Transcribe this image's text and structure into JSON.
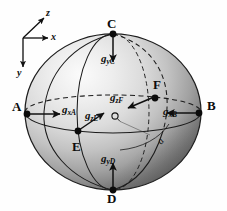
{
  "figure": {
    "background_color": "#fefefe",
    "sphere": {
      "center_x": 113,
      "center_y": 112,
      "radius_x": 88,
      "radius_y": 78,
      "outline_color": "#1a1a1a",
      "highlight_color": "#f2f2f2",
      "shadow_color": "#4a4a4a"
    }
  },
  "axes": {
    "origin_label": "",
    "items": [
      {
        "name": "z-axis",
        "label": "z",
        "direction": "up-right"
      },
      {
        "name": "x-axis",
        "label": "x",
        "direction": "right"
      },
      {
        "name": "y-axis",
        "label": "y",
        "direction": "down"
      }
    ]
  },
  "points": [
    {
      "id": "A",
      "label": "A",
      "position": "left"
    },
    {
      "id": "B",
      "label": "B",
      "position": "right"
    },
    {
      "id": "C",
      "label": "C",
      "position": "top"
    },
    {
      "id": "D",
      "label": "D",
      "position": "bottom"
    },
    {
      "id": "E",
      "label": "E",
      "position": "front-lower-left"
    },
    {
      "id": "F",
      "label": "F",
      "position": "back-upper-right"
    }
  ],
  "vectors": [
    {
      "id": "gxA",
      "symbol": "g",
      "subscript": "xA",
      "at_point": "A",
      "direction": "right"
    },
    {
      "id": "gxB",
      "symbol": "g",
      "subscript": "xB",
      "at_point": "B",
      "direction": "left"
    },
    {
      "id": "gyC",
      "symbol": "g",
      "subscript": "yC",
      "at_point": "C",
      "direction": "down"
    },
    {
      "id": "gyD",
      "symbol": "g",
      "subscript": "yD",
      "at_point": "D",
      "direction": "up"
    },
    {
      "id": "gzE",
      "symbol": "g",
      "subscript": "zE",
      "at_point": "E",
      "direction": "up-right"
    },
    {
      "id": "gzF",
      "symbol": "g",
      "subscript": "zF",
      "at_point": "F",
      "direction": "down-left"
    }
  ],
  "center": {
    "marker_label": "O"
  },
  "annotations": [
    {
      "id": "angle-mark",
      "label": "a",
      "note": "rotated lowercase letter near lower-right"
    }
  ]
}
